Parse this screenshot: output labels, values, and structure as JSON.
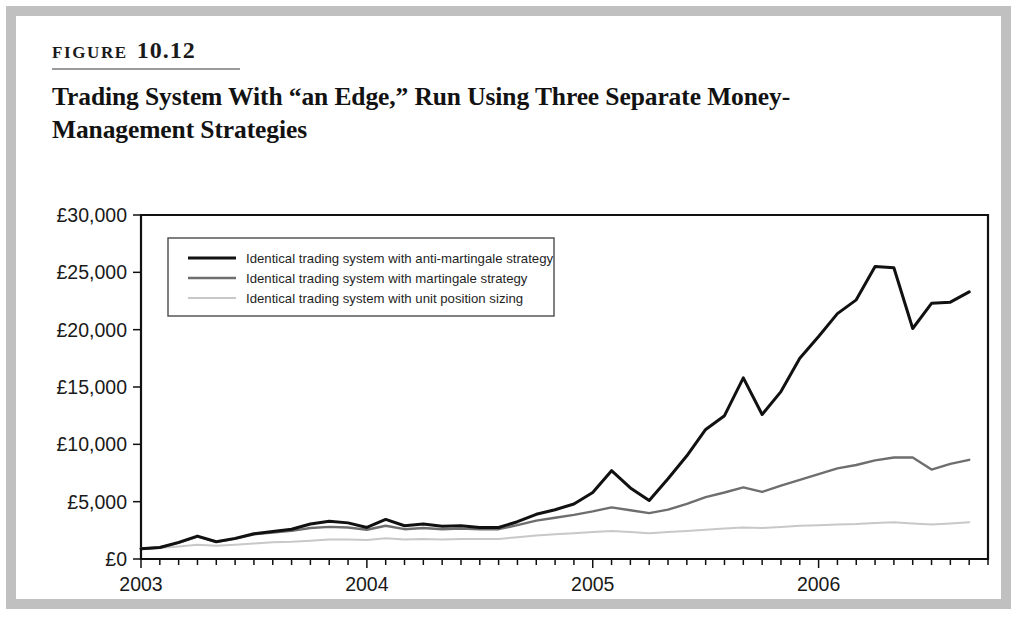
{
  "figure": {
    "label_word": "FIGURE",
    "number": "10.12",
    "title": "Trading System With “an Edge,” Run Using Three Separate Money-Management Strategies"
  },
  "colors": {
    "page_border": "#c0c0c0",
    "background": "#ffffff",
    "axis": "#111111",
    "anti_martingale": "#111111",
    "martingale": "#6e6e6e",
    "unit_position": "#c8c8c8",
    "text": "#1a1a1a"
  },
  "chart_data": {
    "type": "line",
    "title": "Trading System With “an Edge,” Run Using Three Separate Money-Management Strategies",
    "xlabel": "",
    "ylabel": "",
    "grid": false,
    "legend_position": "top-left",
    "ylim": [
      0,
      30000
    ],
    "ytick_labels": [
      "£0",
      "£5,000",
      "£10,000",
      "£15,000",
      "£20,000",
      "£25,000",
      "£30,000"
    ],
    "ytick_values": [
      0,
      5000,
      10000,
      15000,
      20000,
      25000,
      30000
    ],
    "xlim": [
      2003.0,
      2006.75
    ],
    "xtick_labels": [
      "2003",
      "2004",
      "2005",
      "2006"
    ],
    "xtick_values": [
      2003,
      2004,
      2005,
      2006
    ],
    "x_minor_tick_interval_months": 1,
    "x": [
      2003.0,
      2003.0833,
      2003.1667,
      2003.25,
      2003.3333,
      2003.4167,
      2003.5,
      2003.5833,
      2003.6667,
      2003.75,
      2003.8333,
      2003.9167,
      2004.0,
      2004.0833,
      2004.1667,
      2004.25,
      2004.3333,
      2004.4167,
      2004.5,
      2004.5833,
      2004.6667,
      2004.75,
      2004.8333,
      2004.9167,
      2005.0,
      2005.0833,
      2005.1667,
      2005.25,
      2005.3333,
      2005.4167,
      2005.5,
      2005.5833,
      2005.6667,
      2005.75,
      2005.8333,
      2005.9167,
      2006.0,
      2006.0833,
      2006.1667,
      2006.25,
      2006.3333,
      2006.4167,
      2006.5,
      2006.5833,
      2006.6667
    ],
    "series": [
      {
        "name": "Identical trading system with anti-martingale strategy",
        "color": "#111111",
        "line_width": 3.0,
        "values": [
          900,
          1000,
          1450,
          2000,
          1500,
          1800,
          2200,
          2400,
          2600,
          3050,
          3300,
          3150,
          2750,
          3450,
          2900,
          3050,
          2850,
          2900,
          2750,
          2750,
          3250,
          3900,
          4300,
          4800,
          5800,
          7700,
          6200,
          5100,
          7000,
          9000,
          11300,
          12500,
          15800,
          12600,
          14600,
          17500,
          19400,
          21400,
          22600,
          25500,
          25400,
          20100,
          22300,
          22400,
          23300
        ]
      },
      {
        "name": "Identical trading system with martingale strategy",
        "color": "#6e6e6e",
        "line_width": 2.4,
        "values": [
          900,
          1000,
          1400,
          1950,
          1500,
          1750,
          2150,
          2300,
          2450,
          2700,
          2800,
          2750,
          2550,
          2900,
          2600,
          2700,
          2600,
          2650,
          2600,
          2600,
          2950,
          3350,
          3600,
          3850,
          4150,
          4500,
          4250,
          4000,
          4300,
          4800,
          5400,
          5800,
          6250,
          5850,
          6400,
          6900,
          7400,
          7900,
          8200,
          8600,
          8850,
          8850,
          7800,
          8300,
          8650
        ]
      },
      {
        "name": "Identical trading system with unit position sizing",
        "color": "#c8c8c8",
        "line_width": 2.0,
        "values": [
          900,
          950,
          1100,
          1250,
          1150,
          1250,
          1350,
          1450,
          1500,
          1600,
          1700,
          1700,
          1650,
          1800,
          1700,
          1750,
          1700,
          1750,
          1750,
          1750,
          1900,
          2050,
          2150,
          2250,
          2350,
          2450,
          2350,
          2250,
          2350,
          2450,
          2550,
          2650,
          2750,
          2700,
          2800,
          2900,
          2950,
          3000,
          3050,
          3150,
          3200,
          3100,
          3000,
          3100,
          3200
        ]
      }
    ],
    "legend_entries": [
      "Identical trading system with anti-martingale strategy",
      "Identical trading system with martingale strategy",
      "Identical trading system with unit position sizing"
    ]
  }
}
